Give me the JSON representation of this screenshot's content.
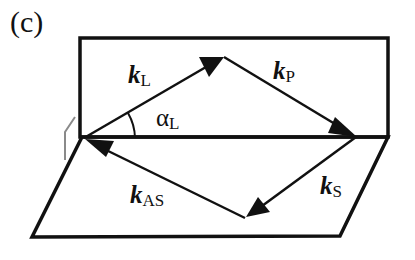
{
  "panel_label": "(c)",
  "colors": {
    "line": "#111111",
    "gray_mark": "#8a8a8a",
    "background": "#ffffff"
  },
  "planes": {
    "upper_rectangle": {
      "x1": 80,
      "y1": 38,
      "x2": 388,
      "y2": 137
    },
    "lower_parallelogram": [
      [
        82,
        137
      ],
      [
        388,
        137
      ],
      [
        340,
        236
      ],
      [
        32,
        237
      ]
    ]
  },
  "vectors": [
    {
      "name": "k_L",
      "symbol": "k",
      "subscript": "L",
      "from": [
        82,
        139
      ],
      "to": [
        224,
        57
      ]
    },
    {
      "name": "k_P",
      "symbol": "k",
      "subscript": "P",
      "from": [
        224,
        57
      ],
      "to": [
        356,
        137
      ]
    },
    {
      "name": "k_S",
      "symbol": "k",
      "subscript": "S",
      "from": [
        356,
        137
      ],
      "to": [
        245,
        218
      ]
    },
    {
      "name": "k_AS",
      "symbol": "k",
      "subscript": "AS",
      "from": [
        245,
        218
      ],
      "to": [
        84,
        139
      ]
    }
  ],
  "labels": {
    "kL": {
      "main": "k",
      "sub": "L"
    },
    "kP": {
      "main": "k",
      "sub": "P"
    },
    "kS": {
      "main": "k",
      "sub": "S"
    },
    "kAS": {
      "main": "k",
      "sub": "AS"
    },
    "alpha": {
      "main": "α",
      "sub": "L"
    }
  }
}
